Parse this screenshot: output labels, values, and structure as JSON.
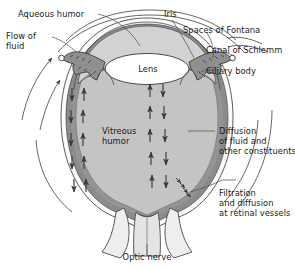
{
  "figure": {
    "type": "anatomical-diagram"
  },
  "colors": {
    "vitreous_fill": "#c4c4c4",
    "anterior_fill": "#d2d2d2",
    "outer_ring": "#8b8b8b",
    "sclera": "#fbfbfb",
    "lens_fill": "#ffffff",
    "outline": "#4a4a4a",
    "text": "#1a1a1a",
    "arrow": "#3a3a3a",
    "nerve_fill": "#e9e9e9"
  },
  "labels": {
    "aqueous_humor": "Aqueous humor",
    "flow_of_fluid_l1": "Flow of",
    "flow_of_fluid_l2": "fluid",
    "iris": "Iris",
    "spaces_of_fontana": "Spaces of Fontana",
    "canal_of_schlemm": "Canal of Schlemm",
    "ciliary_body": "Ciliary body",
    "lens": "Lens",
    "vitreous_humor_l1": "Vitreous",
    "vitreous_humor_l2": "humor",
    "diffusion_l1": "Diffusion",
    "diffusion_l2": "of fluid and",
    "diffusion_l3": "other constituents",
    "filtration_l1": "Filtration",
    "filtration_l2": "and diffusion",
    "filtration_l3": "at retinal vessels",
    "optic_nerve": "Optic nerve"
  },
  "structures": [
    "sclera",
    "choroid",
    "retina",
    "vitreous humor",
    "anterior chamber",
    "lens",
    "iris",
    "ciliary body",
    "canal of Schlemm",
    "spaces of Fontana",
    "optic nerve"
  ],
  "flow_indicators": {
    "internal_arrow_pairs_left": 5,
    "internal_arrow_pairs_right": 5,
    "external_flow_arrows": 3,
    "description": "paired up and down arrows indicating fluid movement within the vitreous humor"
  }
}
